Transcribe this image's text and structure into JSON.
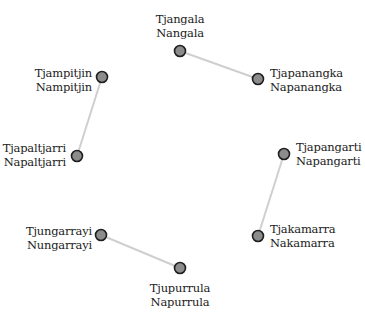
{
  "diagram": {
    "type": "network-graph",
    "colors": {
      "node_fill": "#8c8c8c",
      "node_stroke": "#1e1e1e",
      "edge": "#cfcfcf",
      "text": "#222222",
      "background": "#ffffff"
    },
    "nodes": [
      {
        "id": "tjangala",
        "line1": "Tjangala",
        "line2": "Nangala",
        "x": 180,
        "y": 51
      },
      {
        "id": "tjapanangka",
        "line1": "Tjapanangka",
        "line2": "Napanangka",
        "x": 258,
        "y": 79
      },
      {
        "id": "tjampitjin",
        "line1": "Tjampitjin",
        "line2": "Nampitjin",
        "x": 102,
        "y": 77
      },
      {
        "id": "tjapaltjarri",
        "line1": "Tjapaltjarri",
        "line2": "Napaltjarri",
        "x": 77,
        "y": 156
      },
      {
        "id": "tjapangarti",
        "line1": "Tjapangarti",
        "line2": "Napangarti",
        "x": 284,
        "y": 154
      },
      {
        "id": "tjakamarra",
        "line1": "Tjakamarra",
        "line2": "Nakamarra",
        "x": 258,
        "y": 236
      },
      {
        "id": "tjungarrayi",
        "line1": "Tjungarrayi",
        "line2": "Nungarrayi",
        "x": 101,
        "y": 235
      },
      {
        "id": "tjupurrula",
        "line1": "Tjupurrula",
        "line2": "Napurrula",
        "x": 180,
        "y": 268
      }
    ],
    "edges": [
      {
        "from": "tjangala",
        "to": "tjapanangka"
      },
      {
        "from": "tjampitjin",
        "to": "tjapaltjarri"
      },
      {
        "from": "tjapangarti",
        "to": "tjakamarra"
      },
      {
        "from": "tjungarrayi",
        "to": "tjupurrula"
      }
    ]
  }
}
